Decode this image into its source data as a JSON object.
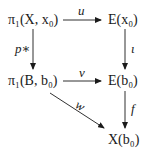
{
  "diagram": {
    "type": "commutative-diagram",
    "nodes": {
      "pi1_X": "π₁(X, x₀)",
      "E_x0": "E(x₀)",
      "pi1_B": "π₁(B, b₀)",
      "E_b0": "E(b₀)",
      "X_b0": "X(b₀)"
    },
    "arrows": {
      "u": "u",
      "p_star": "p∗",
      "iota": "ι",
      "v": "v",
      "w": "w",
      "f": "f"
    },
    "colors": {
      "ink": "#1a1a1a",
      "background": "#ffffff"
    }
  }
}
